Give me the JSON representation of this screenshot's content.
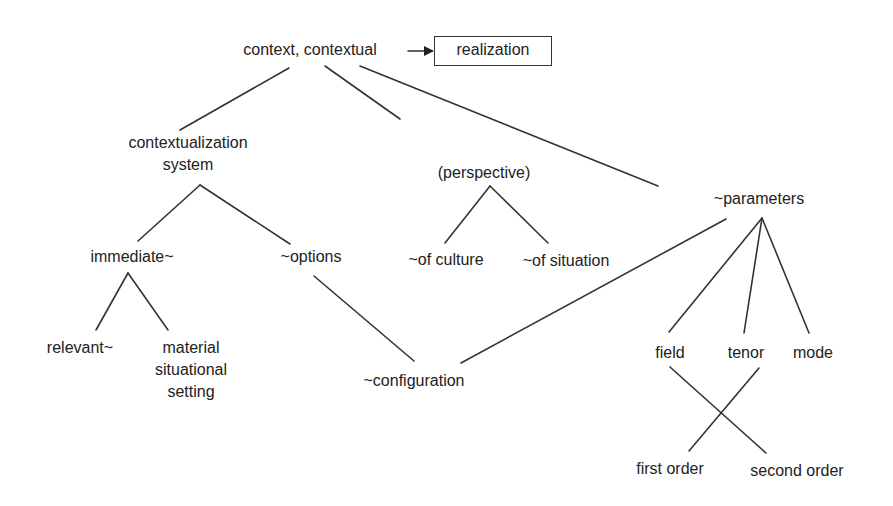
{
  "diagram": {
    "root": {
      "label": "context, contextual"
    },
    "realization_box": {
      "label": "realization"
    },
    "nodes": {
      "contextualization_system": {
        "label": "contextualization\nsystem"
      },
      "perspective": {
        "label": "(perspective)"
      },
      "parameters": {
        "label": "~parameters"
      },
      "immediate": {
        "label": "immediate~"
      },
      "options": {
        "label": "~options"
      },
      "of_culture": {
        "label": "~of culture"
      },
      "of_situation": {
        "label": "~of situation"
      },
      "relevant": {
        "label": "relevant~"
      },
      "material_setting": {
        "label": "material\nsituational\nsetting"
      },
      "configuration": {
        "label": "~configuration"
      },
      "field": {
        "label": "field"
      },
      "tenor": {
        "label": "tenor"
      },
      "mode": {
        "label": "mode"
      },
      "first_order": {
        "label": "first order"
      },
      "second_order": {
        "label": "second order"
      }
    },
    "edges": [
      {
        "from": "context, contextual",
        "to": "realization",
        "type": "arrow"
      },
      {
        "from": "context, contextual",
        "to": "contextualization system"
      },
      {
        "from": "context, contextual",
        "to": "(perspective)"
      },
      {
        "from": "context, contextual",
        "to": "~parameters"
      },
      {
        "from": "contextualization system",
        "to": "immediate~"
      },
      {
        "from": "contextualization system",
        "to": "~options"
      },
      {
        "from": "(perspective)",
        "to": "~of culture"
      },
      {
        "from": "(perspective)",
        "to": "~of situation"
      },
      {
        "from": "immediate~",
        "to": "relevant~"
      },
      {
        "from": "immediate~",
        "to": "material situational setting"
      },
      {
        "from": "~options",
        "to": "~configuration"
      },
      {
        "from": "~parameters",
        "to": "~configuration"
      },
      {
        "from": "~parameters",
        "to": "field"
      },
      {
        "from": "~parameters",
        "to": "tenor"
      },
      {
        "from": "~parameters",
        "to": "mode"
      },
      {
        "from": "field",
        "to": "second order"
      },
      {
        "from": "tenor",
        "to": "first order"
      }
    ],
    "colors": {
      "line": "#333333",
      "text": "#222222",
      "background": "#ffffff"
    }
  }
}
